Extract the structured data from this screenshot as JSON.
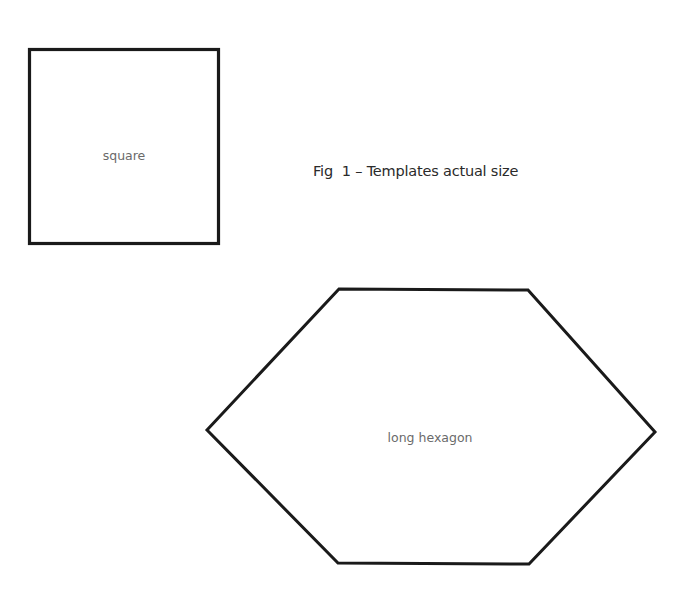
{
  "figure": {
    "caption": "Fig  1 – Templates actual size",
    "stroke_color": "#1a1a1a",
    "label_color": "#6a6a6a",
    "shapes": [
      {
        "id": "square",
        "type": "square",
        "label": "square"
      },
      {
        "id": "long-hexagon",
        "type": "long hexagon",
        "label": "long hexagon"
      }
    ]
  }
}
